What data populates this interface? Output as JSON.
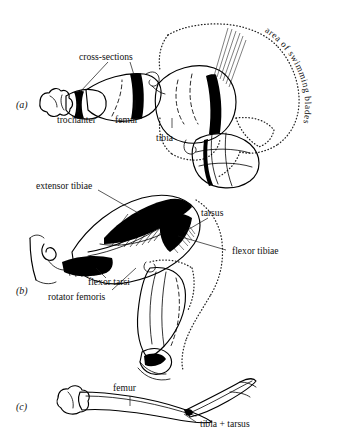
{
  "figure": {
    "background_color": "#ffffff",
    "ink_color": "#000000",
    "panels": [
      {
        "id": "a",
        "letter": "(a)",
        "labels": [
          {
            "key": "cross_sections",
            "text": "cross-sections"
          },
          {
            "key": "trochanter",
            "text": "trochanter"
          },
          {
            "key": "femur",
            "text": "femur"
          },
          {
            "key": "tibia",
            "text": "tibia"
          },
          {
            "key": "area_swimming_blades",
            "text": "area of swimming blades"
          }
        ]
      },
      {
        "id": "b",
        "letter": "(b)",
        "labels": [
          {
            "key": "extensor_tibiae",
            "text": "extensor tibiae"
          },
          {
            "key": "tarsus",
            "text": "tarsus"
          },
          {
            "key": "flexor_tibiae",
            "text": "flexor tibiae"
          },
          {
            "key": "flexor_tarsi",
            "text": "flexor tarsi"
          },
          {
            "key": "rotator_femoris",
            "text": "rotator femoris"
          }
        ]
      },
      {
        "id": "c",
        "letter": "(c)",
        "labels": [
          {
            "key": "femur",
            "text": "femur"
          },
          {
            "key": "tibia_tarsus",
            "text": "tibia + tarsus"
          }
        ]
      }
    ]
  },
  "panel_a": {
    "letter": "(a)",
    "label_cross_sections": "cross-sections",
    "label_trochanter": "trochanter",
    "label_femur": "femur",
    "label_tibia": "tibia",
    "label_area_swimming_blades": "area of swimming blades"
  },
  "panel_b": {
    "letter": "(b)",
    "label_extensor_tibiae": "extensor tibiae",
    "label_tarsus": "tarsus",
    "label_flexor_tibiae": "flexor tibiae",
    "label_flexor_tarsi": "flexor tarsi",
    "label_rotator_femoris": "rotator femoris"
  },
  "panel_c": {
    "letter": "(c)",
    "label_femur": "femur",
    "label_tibia_tarsus": "tibia + tarsus"
  }
}
